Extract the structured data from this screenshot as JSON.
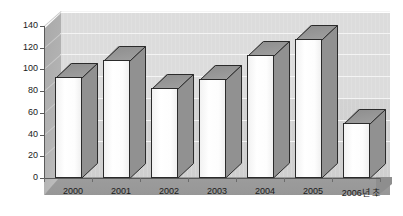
{
  "chart_data": {
    "type": "bar",
    "title": "",
    "subtitle": "",
    "xlabel": "",
    "ylabel": "",
    "categories": [
      "2000",
      "2001",
      "2002",
      "2003",
      "2004",
      "2005",
      "2006년 초"
    ],
    "values": [
      92,
      108,
      82,
      90,
      112,
      127,
      50
    ],
    "series": [
      {
        "name": "",
        "values": [
          92,
          108,
          82,
          90,
          112,
          127,
          50
        ]
      }
    ],
    "ylim": [
      0,
      140
    ],
    "ytick_labels": [
      "0",
      "20",
      "40",
      "60",
      "80",
      "100",
      "120",
      "140"
    ],
    "ytick_values": [
      0,
      20,
      40,
      60,
      80,
      100,
      120,
      140
    ],
    "grid": true,
    "grid_axis": "y",
    "legend": false,
    "legend_position": "none",
    "three_d": true,
    "annotations": []
  },
  "colors": {
    "bar_face": "#ffffff",
    "bar_side": "#919191",
    "bar_top": "#7d7d7d",
    "bar_outline": "#2b2b2b",
    "wall_upper": "#dcdcdc",
    "wall_lower": "#cfcfcf",
    "side_wall": "#b4b4b4",
    "floor": "#9b9b9b",
    "gridline": "#f4f4f4",
    "axis": "#5a5a5a",
    "text": "#1a1a1a",
    "background": "#ffffff"
  }
}
